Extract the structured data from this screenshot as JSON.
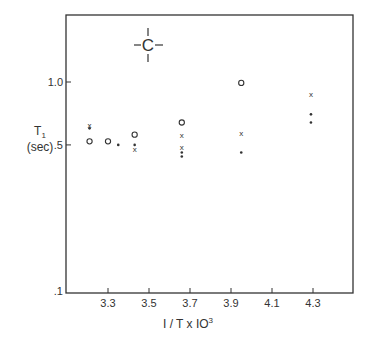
{
  "chart_data": {
    "type": "scatter",
    "title": "",
    "annotation": "-C-",
    "xlabel": "1/T x 10^3",
    "xlabel_display": "I / T x IO",
    "xlabel_sup": "3",
    "ylabel": "T1",
    "ylabel_sub": "1",
    "ylabel_main": "T",
    "ylabel_unit": "(sec)",
    "y_scale": "log",
    "xlim": [
      3.1,
      4.5
    ],
    "ylim": [
      0.1,
      1.6
    ],
    "x_ticks": [
      {
        "value": 3.3,
        "label": "3.3"
      },
      {
        "value": 3.5,
        "label": "3.5"
      },
      {
        "value": 3.7,
        "label": "3.7"
      },
      {
        "value": 3.9,
        "label": "3.9"
      },
      {
        "value": 4.1,
        "label": "4.1"
      },
      {
        "value": 4.3,
        "label": "4.3"
      }
    ],
    "y_ticks": [
      {
        "value": 0.1,
        "label": ".1"
      },
      {
        "value": 0.5,
        "label": ".5"
      },
      {
        "value": 1.0,
        "label": "1.0"
      }
    ],
    "grid": false,
    "legend": null,
    "series": [
      {
        "name": "open circle",
        "marker": "o",
        "points": [
          [
            3.21,
            0.52
          ],
          [
            3.3,
            0.52
          ],
          [
            3.43,
            0.56
          ],
          [
            3.66,
            0.64
          ],
          [
            3.95,
            0.99
          ]
        ]
      },
      {
        "name": "cross",
        "marker": "x",
        "points": [
          [
            3.21,
            0.62
          ],
          [
            3.43,
            0.48
          ],
          [
            3.66,
            0.56
          ],
          [
            3.66,
            0.49
          ],
          [
            3.95,
            0.57
          ],
          [
            4.29,
            0.88
          ]
        ]
      },
      {
        "name": "filled dot",
        "marker": "dot",
        "points": [
          [
            3.21,
            0.6
          ],
          [
            3.35,
            0.5
          ],
          [
            3.43,
            0.5
          ],
          [
            3.66,
            0.46
          ],
          [
            3.66,
            0.44
          ],
          [
            3.95,
            0.46
          ],
          [
            4.29,
            0.7
          ],
          [
            4.29,
            0.64
          ]
        ]
      }
    ]
  }
}
